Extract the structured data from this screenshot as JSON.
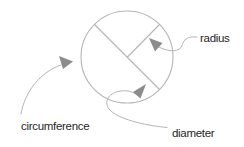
{
  "diagram": {
    "labels": {
      "circumference": "circumference",
      "radius": "radius",
      "diameter": "diameter"
    },
    "colors": {
      "line": "#b5b5b5",
      "arrow": "#8c8c8c",
      "text": "#262626",
      "background": "#ffffff"
    }
  }
}
